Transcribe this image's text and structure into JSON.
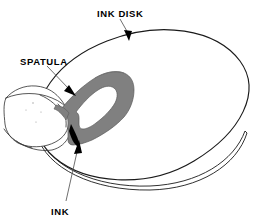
{
  "figure": {
    "name": "ink-disk-spatula-diagram",
    "background_color": "#ffffff",
    "width": 260,
    "height": 218
  },
  "labels": {
    "ink_disk": "INK  DISK",
    "spatula": "SPATULA",
    "ink": "INK"
  },
  "colors": {
    "outline": "#1a1a1a",
    "spatula_fill": "#808080",
    "spatula_stroke": "#5a5a5a",
    "hand_stroke": "#3a3a3a",
    "leader_line": "#555555",
    "arrowhead": "#000000",
    "slot_fill": "#ffffff",
    "background": "#ffffff"
  },
  "parts": {
    "disk": {
      "name": "ink-disk",
      "shape": "ellipse",
      "cx": 143,
      "cy": 103,
      "rx": 105,
      "ry": 80,
      "rotation_deg": -8,
      "edge_thickness": 3
    },
    "spatula": {
      "name": "spatula",
      "fill": "#808080",
      "has_slot": true
    },
    "hand": {
      "name": "hand",
      "stroke": "#3a3a3a"
    },
    "ink_deposit": {
      "name": "ink-deposit",
      "fill": "#000000"
    }
  },
  "leaders": {
    "ink_disk": {
      "label_x": 97,
      "label_y": 14,
      "from_x": 120,
      "from_y": 19,
      "to_x": 129,
      "to_y": 40
    },
    "spatula": {
      "label_x": 20,
      "label_y": 62,
      "from_x": 47,
      "from_y": 66,
      "to_x": 74,
      "to_y": 95
    },
    "ink": {
      "label_x": 51,
      "label_y": 212,
      "from_x": 66,
      "from_y": 200,
      "to_x": 79,
      "to_y": 142
    }
  }
}
